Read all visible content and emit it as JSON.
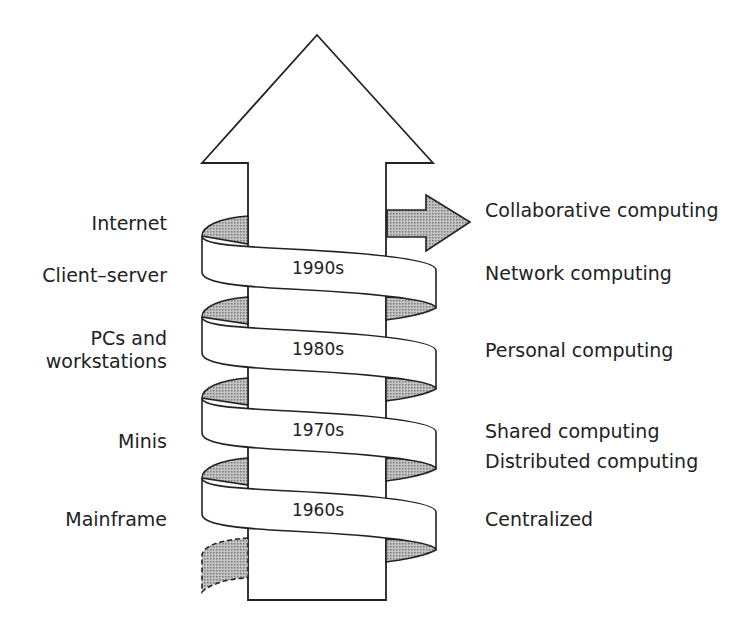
{
  "diagram": {
    "colors": {
      "stroke": "#222222",
      "shade": "#a8a8a8",
      "background": "#ffffff"
    },
    "eras": [
      {
        "decade": "1990s",
        "technology": "Client–server",
        "paradigm": "Network computing"
      },
      {
        "decade": "1980s",
        "technology": "PCs and workstations",
        "paradigm": "Personal computing"
      },
      {
        "decade": "1970s",
        "technology": "Minis",
        "paradigm": "Shared computing"
      },
      {
        "decade": "1960s",
        "technology": "Mainframe",
        "paradigm": "Centralized"
      }
    ],
    "left_labels": {
      "internet": "Internet",
      "client_server": "Client–server",
      "pcs_line1": "PCs and",
      "pcs_line2": "workstations",
      "minis": "Minis",
      "mainframe": "Mainframe"
    },
    "right_labels": {
      "collaborative": "Collaborative computing",
      "network": "Network computing",
      "personal": "Personal computing",
      "shared": "Shared computing",
      "distributed": "Distributed computing",
      "centralized": "Centralized"
    },
    "decades": {
      "d1990": "1990s",
      "d1980": "1980s",
      "d1970": "1970s",
      "d1960": "1960s"
    },
    "icons": {
      "main": "up-arrow",
      "future": "right-arrow"
    }
  }
}
